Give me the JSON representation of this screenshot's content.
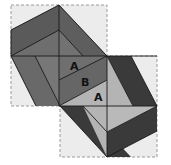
{
  "diagram": {
    "type": "geometric-dissection",
    "colors": {
      "background": "#ffffff",
      "box_fill": "#ececec",
      "dashed_border": "#9a9a9a",
      "dark_gray": "#5c5c5c",
      "mid_gray": "#737373",
      "darkest": "#3a3a3a",
      "light_gray": "#b4b4b4",
      "line": "#1a1a1a"
    },
    "labels": [
      {
        "text": "A",
        "x": 70,
        "y": 70
      },
      {
        "text": "B",
        "x": 81,
        "y": 86
      },
      {
        "text": "A",
        "x": 94,
        "y": 101
      }
    ]
  }
}
